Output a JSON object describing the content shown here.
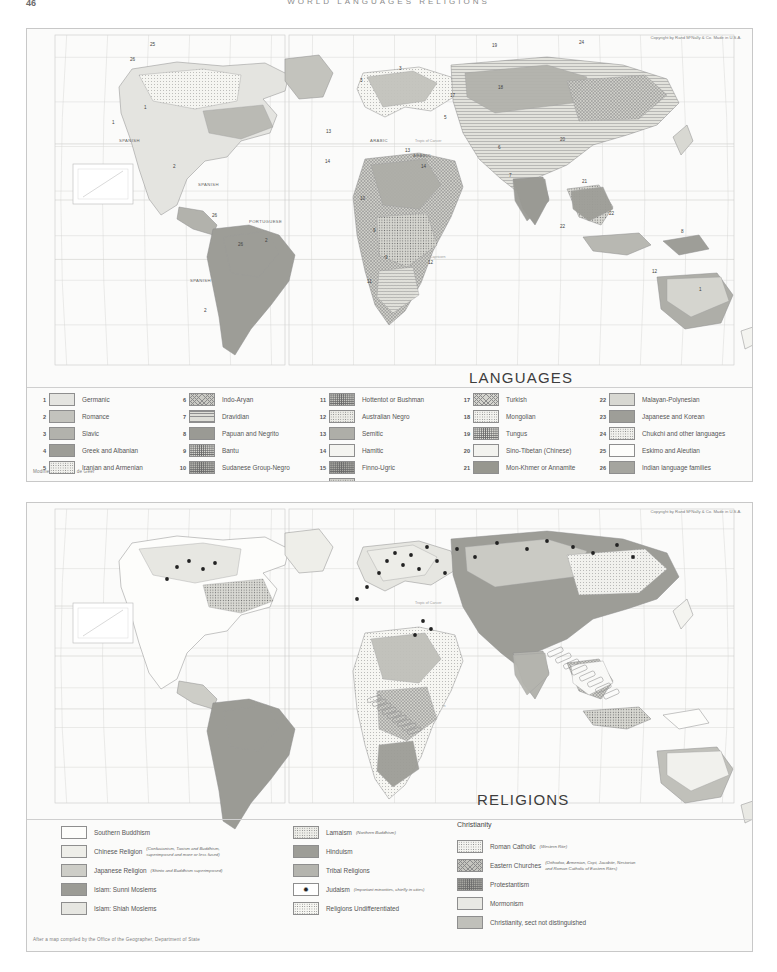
{
  "page": {
    "folio": "46",
    "running_head": "WORLD   LANGUAGES   RELIGIONS"
  },
  "copyright": "Copyright by Rand MᶜNally & Co.\nMade in U.S.A.",
  "languages_map": {
    "title": "LANGUAGES",
    "credit": "Modified from Sten de Geer",
    "map_labels": [
      {
        "text": "SPANISH",
        "x": 118,
        "y": 141
      },
      {
        "text": "SPANISH",
        "x": 197,
        "y": 185
      },
      {
        "text": "PORTUGUESE",
        "x": 248,
        "y": 222
      },
      {
        "text": "SPANISH",
        "x": 189,
        "y": 281
      },
      {
        "text": "ARABIC",
        "x": 369,
        "y": 141
      },
      {
        "text": "ARABIC",
        "x": 412,
        "y": 156
      }
    ],
    "map_numbers": [
      {
        "n": "25",
        "x": 149,
        "y": 45
      },
      {
        "n": "26",
        "x": 129,
        "y": 60
      },
      {
        "n": "1",
        "x": 143,
        "y": 108
      },
      {
        "n": "1",
        "x": 111,
        "y": 123
      },
      {
        "n": "2",
        "x": 172,
        "y": 167
      },
      {
        "n": "26",
        "x": 211,
        "y": 216
      },
      {
        "n": "26",
        "x": 237,
        "y": 245
      },
      {
        "n": "2",
        "x": 264,
        "y": 241
      },
      {
        "n": "2",
        "x": 203,
        "y": 311
      },
      {
        "n": "3",
        "x": 359,
        "y": 81
      },
      {
        "n": "3",
        "x": 398,
        "y": 69
      },
      {
        "n": "13",
        "x": 325,
        "y": 132
      },
      {
        "n": "13",
        "x": 404,
        "y": 151
      },
      {
        "n": "14",
        "x": 324,
        "y": 162
      },
      {
        "n": "14",
        "x": 420,
        "y": 167
      },
      {
        "n": "10",
        "x": 359,
        "y": 199
      },
      {
        "n": "9",
        "x": 372,
        "y": 231
      },
      {
        "n": "9",
        "x": 384,
        "y": 258
      },
      {
        "n": "11",
        "x": 366,
        "y": 282
      },
      {
        "n": "12",
        "x": 427,
        "y": 263
      },
      {
        "n": "19",
        "x": 491,
        "y": 46
      },
      {
        "n": "24",
        "x": 578,
        "y": 43
      },
      {
        "n": "17",
        "x": 449,
        "y": 96
      },
      {
        "n": "18",
        "x": 497,
        "y": 88
      },
      {
        "n": "5",
        "x": 443,
        "y": 118
      },
      {
        "n": "20",
        "x": 559,
        "y": 140
      },
      {
        "n": "6",
        "x": 497,
        "y": 148
      },
      {
        "n": "7",
        "x": 508,
        "y": 176
      },
      {
        "n": "21",
        "x": 581,
        "y": 182
      },
      {
        "n": "22",
        "x": 608,
        "y": 214
      },
      {
        "n": "22",
        "x": 559,
        "y": 227
      },
      {
        "n": "8",
        "x": 680,
        "y": 232
      },
      {
        "n": "12",
        "x": 651,
        "y": 272
      },
      {
        "n": "1",
        "x": 698,
        "y": 290
      }
    ],
    "legend_columns": [
      {
        "items": [
          {
            "num": "1",
            "label": "Germanic",
            "fill": "f-plain",
            "color": "#e4e4e0"
          },
          {
            "num": "2",
            "label": "Romance",
            "fill": "f-plain",
            "color": "#c3c3bd"
          },
          {
            "num": "3",
            "label": "Slavic",
            "fill": "f-plain",
            "color": "#b2b2ac"
          },
          {
            "num": "4",
            "label": "Greek and Albanian",
            "fill": "f-plain",
            "color": "#9d9d97"
          },
          {
            "num": "5",
            "label": "Iranian and Armenian",
            "fill": "f-dots",
            "color": "#f0f0ec"
          }
        ]
      },
      {
        "items": [
          {
            "num": "6",
            "label": "Indo-Aryan",
            "fill": "f-cross",
            "color": "#c9c9c3"
          },
          {
            "num": "7",
            "label": "Dravidian",
            "fill": "f-hlines",
            "color": "#ddddd7"
          },
          {
            "num": "8",
            "label": "Papuan and Negrito",
            "fill": "f-plain",
            "color": "#9a9a94"
          },
          {
            "num": "9",
            "label": "Bantu",
            "fill": "f-dots-d",
            "color": "#d6d6d0"
          },
          {
            "num": "10",
            "label": "Sudanese Group-Negro",
            "fill": "f-dots-d",
            "color": "#b8b8b2"
          }
        ]
      },
      {
        "items": [
          {
            "num": "11",
            "label": "Hottentot or Bushman",
            "fill": "f-dots-d",
            "color": "#c6c6c0"
          },
          {
            "num": "12",
            "label": "Australian Negro",
            "fill": "f-dots",
            "color": "#ebebe6"
          },
          {
            "num": "13",
            "label": "Semitic",
            "fill": "f-plain",
            "color": "#aeaea8"
          },
          {
            "num": "14",
            "label": "Hamitic",
            "fill": "f-plain",
            "color": "#f4f4f0"
          },
          {
            "num": "15",
            "label": "Finno-Ugric",
            "fill": "f-dots-d",
            "color": "#a8a8a2"
          },
          {
            "num": "16",
            "label": "Samoyede",
            "fill": "f-dots",
            "color": "#d2d2cc"
          }
        ]
      },
      {
        "items": [
          {
            "num": "17",
            "label": "Turkish",
            "fill": "f-cross",
            "color": "#d4d4ce"
          },
          {
            "num": "18",
            "label": "Mongolian",
            "fill": "f-dots",
            "color": "#f2f2ee"
          },
          {
            "num": "19",
            "label": "Tungus",
            "fill": "f-dots-d",
            "color": "#dcdcd6"
          },
          {
            "num": "20",
            "label": "Sino-Tibetan (Chinese)",
            "fill": "f-plain",
            "color": "#f3f3ef"
          },
          {
            "num": "21",
            "label": "Mon-Khmer or Annamite",
            "fill": "f-plain",
            "color": "#97978f"
          }
        ]
      },
      {
        "items": [
          {
            "num": "22",
            "label": "Malayan-Polynesian",
            "fill": "f-plain",
            "color": "#d8d8d2"
          },
          {
            "num": "23",
            "label": "Japanese and Korean",
            "fill": "f-plain",
            "color": "#9e9e98"
          },
          {
            "num": "24",
            "label": "Chukchi and other languages",
            "fill": "f-dots",
            "color": "#f0f0ec"
          },
          {
            "num": "25",
            "label": "Eskimo and Aleutian",
            "fill": "f-plain",
            "color": "#fdfdfb"
          },
          {
            "num": "26",
            "label": "Indian language families",
            "fill": "f-plain",
            "color": "#a5a59f"
          }
        ]
      }
    ]
  },
  "religions_map": {
    "title": "RELIGIONS",
    "credit": "After a map compiled by the Office of the Geographer, Department of State",
    "christianity_heading": "Christianity",
    "legend_columns": [
      {
        "items": [
          {
            "label": "Southern Buddhism",
            "note": "",
            "fill": "f-plain",
            "color": "#fdfdfb"
          },
          {
            "label": "Chinese Religion",
            "note": "(Confucianism, Taoism and Buddhism,\nsuperimposed and more or less fused)",
            "fill": "f-plain",
            "color": "#eeeee9"
          },
          {
            "label": "Japanese Religion",
            "note": "(Shinto and Buddhism superimposed)",
            "fill": "f-plain",
            "color": "#cdcdc7"
          },
          {
            "label": "Islam: Sunni Moslems",
            "note": "",
            "fill": "f-plain",
            "color": "#9b9b95"
          },
          {
            "label": "Islam: Shiah Moslems",
            "note": "",
            "fill": "f-plain",
            "color": "#e6e6e1"
          }
        ]
      },
      {
        "items": [
          {
            "label": "Lamaism",
            "note": "(Northern Buddhism)",
            "fill": "f-dots",
            "color": "#ededE8"
          },
          {
            "label": "Hinduism",
            "note": "",
            "fill": "f-plain",
            "color": "#9d9d97"
          },
          {
            "label": "Tribal Religions",
            "note": "",
            "fill": "f-plain",
            "color": "#b4b4ae"
          },
          {
            "label": "Judaism",
            "note": "(Important minorities, chiefly in cities)",
            "fill": "star",
            "color": "#ffffff"
          },
          {
            "label": "Religions Undifferentiated",
            "note": "",
            "fill": "f-dots",
            "color": "#f6f6f2"
          }
        ]
      },
      {
        "items": [
          {
            "label": "Roman Catholic",
            "note": "(Western Rite)",
            "fill": "f-dots",
            "color": "#f4f4f0"
          },
          {
            "label": "Eastern Churches",
            "note": "(Orthodox, Armenian, Copt, Jacobite, Nestorian\nand Roman Catholic of Eastern Rites)",
            "fill": "f-cross",
            "color": "#c4c4be"
          },
          {
            "label": "Protestantism",
            "note": "",
            "fill": "f-dots-d",
            "color": "#a9a9a3"
          },
          {
            "label": "Mormonism",
            "note": "",
            "fill": "f-plain",
            "color": "#e9e9e4"
          },
          {
            "label": "Christianity, sect not distinguished",
            "note": "",
            "fill": "f-plain",
            "color": "#c0c0ba"
          }
        ]
      }
    ]
  },
  "graticule": {
    "tropic_cancer": "Tropic of Cancer",
    "equator": "Equator",
    "tropic_capricorn": "Tropic of Capricorn",
    "lat_labels": [
      "60",
      "40",
      "20",
      "0",
      "20",
      "40",
      "60"
    ],
    "lon_labels": [
      "160",
      "140",
      "120",
      "100",
      "80",
      "60",
      "40",
      "20",
      "0",
      "20",
      "40",
      "60",
      "80",
      "100",
      "120",
      "140",
      "160"
    ]
  }
}
